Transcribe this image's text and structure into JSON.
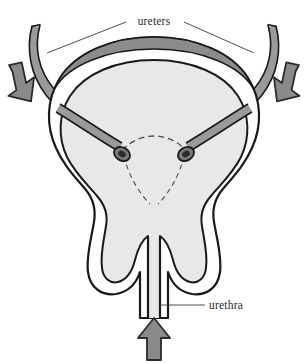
{
  "figure": {
    "background_color": "#ffffff",
    "labels": {
      "ureters": "ureters",
      "urethra": "urethra"
    },
    "colors": {
      "outline": "#1a1a1a",
      "lumen_fill": "#e8e8e8",
      "wall_fill": "#ffffff",
      "dome_band": "#8c8c8c",
      "ureter_tube": "#9a9a9a",
      "arrow_fill": "#8a8a8a",
      "arrow_outline": "#2b2b2b",
      "leader_line": "#3a3a3a",
      "dashed_line": "#4a4a4a",
      "orifice_ring": "#7a7a7a",
      "orifice_center": "#2b2b2b",
      "label_text": "#2a2a2a"
    },
    "parts": [
      {
        "name": "left-ureter",
        "label": "ureters"
      },
      {
        "name": "right-ureter",
        "label": "ureters"
      },
      {
        "name": "bladder-dome-muscle-band",
        "label": ""
      },
      {
        "name": "bladder-wall",
        "label": ""
      },
      {
        "name": "bladder-lumen",
        "label": ""
      },
      {
        "name": "left-ureteral-orifice",
        "label": ""
      },
      {
        "name": "right-ureteral-orifice",
        "label": ""
      },
      {
        "name": "trigone-dashed-outline",
        "label": ""
      },
      {
        "name": "prostate-left-lobe",
        "label": ""
      },
      {
        "name": "prostate-right-lobe",
        "label": ""
      },
      {
        "name": "urethra",
        "label": "urethra"
      }
    ],
    "arrows": [
      {
        "name": "left-inflow-arrow",
        "direction": "down-right"
      },
      {
        "name": "right-inflow-arrow",
        "direction": "down-left"
      },
      {
        "name": "urethra-inflow-arrow",
        "direction": "up"
      }
    ]
  }
}
